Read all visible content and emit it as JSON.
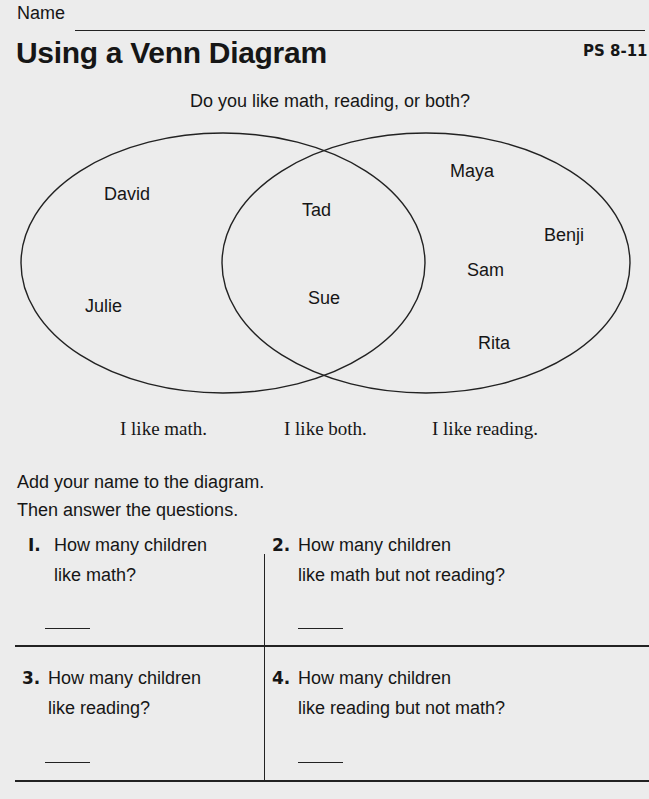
{
  "header": {
    "name_label": "Name",
    "title": "Using a Venn Diagram",
    "code": "PS 8-11"
  },
  "diagram": {
    "prompt": "Do you like math, reading, or both?",
    "sets": [
      {
        "label": "I like math.",
        "names": [
          "David",
          "Julie"
        ]
      },
      {
        "label": "I like both.",
        "names": [
          "Tad",
          "Sue"
        ]
      },
      {
        "label": "I like reading.",
        "names": [
          "Maya",
          "Benji",
          "Sam",
          "Rita"
        ]
      }
    ],
    "names": {
      "david": "David",
      "julie": "Julie",
      "tad": "Tad",
      "sue": "Sue",
      "maya": "Maya",
      "benji": "Benji",
      "sam": "Sam",
      "rita": "Rita"
    },
    "labels": {
      "math": "I like math.",
      "both": "I like both.",
      "reading": "I like reading."
    }
  },
  "instructions": {
    "line1": "Add your name to the diagram.",
    "line2": "Then answer the questions."
  },
  "questions": [
    {
      "number": "I.",
      "line1": "How many children",
      "line2": "like math?",
      "answer": ""
    },
    {
      "number": "2.",
      "line1": "How many children",
      "line2": "like math but not reading?",
      "answer": ""
    },
    {
      "number": "3.",
      "line1": "How many children",
      "line2": "like reading?",
      "answer": ""
    },
    {
      "number": "4.",
      "line1": "How many children",
      "line2": "like reading but not math?",
      "answer": ""
    }
  ]
}
